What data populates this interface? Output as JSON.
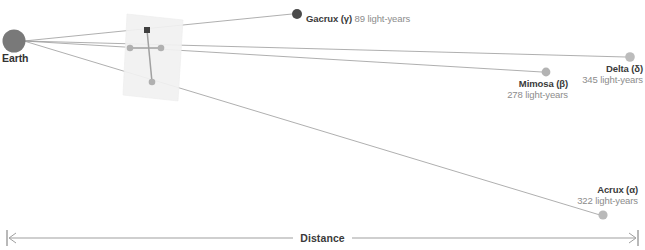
{
  "diagram": {
    "title_axis": "Distance",
    "origin": {
      "label": "Earth",
      "name": "earth"
    },
    "plane": {
      "name": "sky-plane"
    },
    "stars": [
      {
        "id": "gacrux",
        "name": "Gacrux",
        "greek": "(γ)",
        "distance": "89 light-years",
        "name_with_greek": "Gacrux (γ)",
        "inline_label": "89 light-years",
        "color": "#4a4a4a",
        "dot_r": 5.0
      },
      {
        "id": "mimosa",
        "name": "Mimosa",
        "greek": "(β)",
        "distance": "278 light-years",
        "name_with_greek": "Mimosa (β)",
        "inline_label": "278 light-years",
        "color": "#b3b3b3",
        "dot_r": 4.4
      },
      {
        "id": "acrux",
        "name": "Acrux",
        "greek": "(α)",
        "distance": "322 light-years",
        "name_with_greek": "Acrux (α)",
        "inline_label": "322 light-years",
        "color": "#b9b9b9",
        "dot_r": 4.6
      },
      {
        "id": "delta",
        "name": "Delta",
        "greek": "(δ)",
        "distance": "345 light-years",
        "name_with_greek": "Delta (δ)",
        "inline_label": "345 light-years",
        "color": "#bcbcbc",
        "dot_r": 4.8
      }
    ],
    "colors": {
      "earth": "#7a7a7a",
      "sightline": "#9a9a9a",
      "plane_fill": "#f2f2f2",
      "constellation_line": "#9d9d9d",
      "axis": "#8f8f8f",
      "text_dark": "#3a3a3a",
      "text_muted": "#8c8c8c"
    }
  }
}
